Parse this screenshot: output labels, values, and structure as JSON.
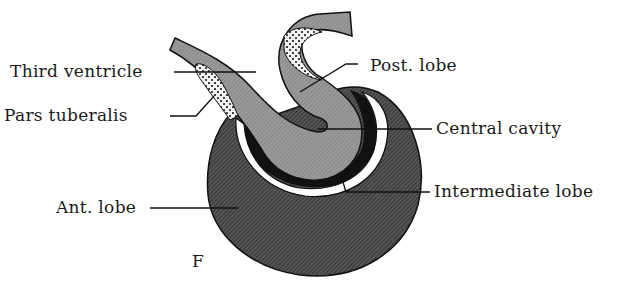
{
  "figure": {
    "panel_letter": "F"
  },
  "labels": {
    "third_ventricle": "Third ventricle",
    "pars_tuberalis": "Pars tuberalis",
    "ant_lobe": "Ant. lobe",
    "post_lobe": "Post. lobe",
    "central_cavity": "Central cavity",
    "intermediate_lobe": "Intermediate lobe"
  },
  "colors": {
    "anterior_lobe": "#4a4a4a",
    "posterior_lobe": "#8c8c8c",
    "intermediate_lobe": "#111111",
    "cavity": "#ffffff",
    "outline": "#111111",
    "text": "#1a1a1a"
  }
}
